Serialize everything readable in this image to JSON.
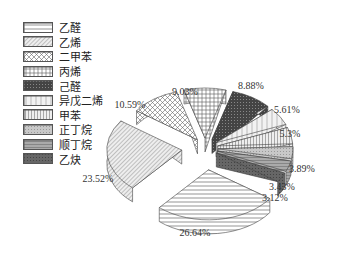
{
  "chart_data": {
    "type": "pie",
    "style": "3d-exploded",
    "title": "",
    "legend_position": "top-left",
    "categories": [
      "乙醛",
      "乙烯",
      "二甲苯",
      "丙烯",
      "己醛",
      "异戊二烯",
      "甲苯",
      "正丁烷",
      "顺丁烷",
      "乙炔"
    ],
    "values": [
      26.64,
      23.52,
      10.59,
      9.03,
      8.88,
      5.61,
      5.3,
      3.89,
      3.43,
      3.12
    ],
    "labels": [
      "26.64%",
      "23.52%",
      "10.59%",
      "9.03%",
      "8.88%",
      "5.61%",
      "5.3%",
      "3.89%",
      "3.43%",
      "3.12%"
    ]
  },
  "legend": {
    "items": [
      {
        "label": "乙醛",
        "pattern": "hlines"
      },
      {
        "label": "乙烯",
        "pattern": "diag"
      },
      {
        "label": "二甲苯",
        "pattern": "cross"
      },
      {
        "label": "丙烯",
        "pattern": "grid"
      },
      {
        "label": "己醛",
        "pattern": "dark"
      },
      {
        "label": "异戊二烯",
        "pattern": "light-vert"
      },
      {
        "label": "甲苯",
        "pattern": "vlines"
      },
      {
        "label": "正丁烷",
        "pattern": "gray-dots"
      },
      {
        "label": "顺丁烷",
        "pattern": "gray-hl"
      },
      {
        "label": "乙炔",
        "pattern": "darkgray"
      }
    ]
  }
}
